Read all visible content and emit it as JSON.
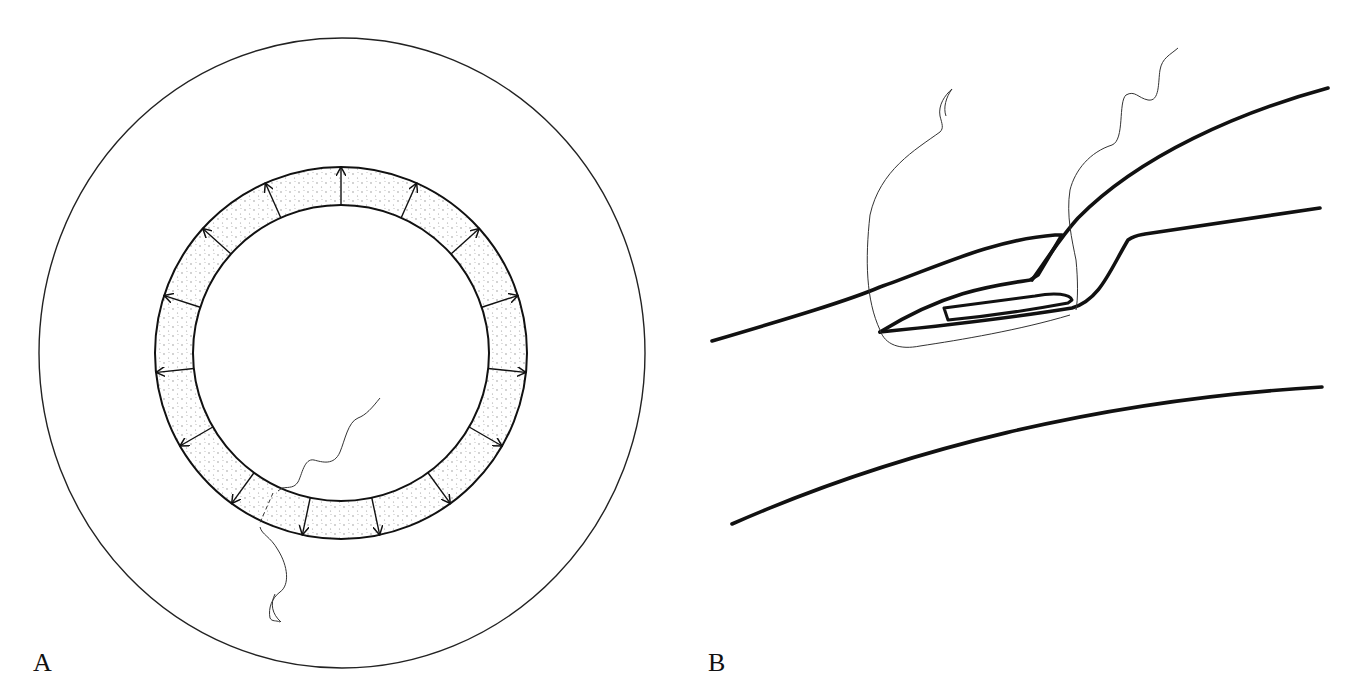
{
  "figure": {
    "panels": [
      {
        "id": "A",
        "label": "A",
        "description": "Cross-section: large outer circle containing a stippled annular ring with radial outward-pointing arrows; a wavy thread crosses the ring with a dashed segment"
      },
      {
        "id": "B",
        "label": "B",
        "description": "Longitudinal view: curved thick lines forming a channel with an elongated flap/implant, thin outline loop and wavy threads"
      }
    ],
    "colors": {
      "line": "#111111",
      "stipple": "#888888",
      "background": "#ffffff"
    },
    "panel_a": {
      "outer_ellipse": {
        "cx": 342,
        "cy": 353,
        "rx": 303,
        "ry": 315
      },
      "ring": {
        "cx": 341,
        "cy": 353,
        "r_outer": 186,
        "r_inner": 148
      },
      "arrow_count": 15
    }
  }
}
